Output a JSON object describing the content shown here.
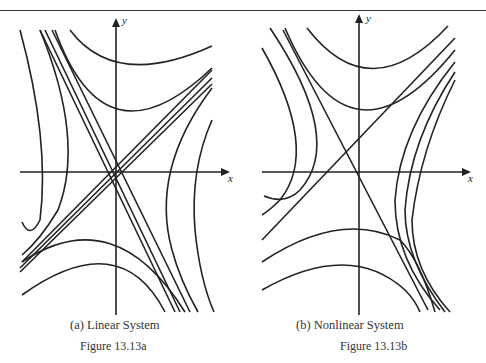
{
  "panels": [
    {
      "caption": "(a) Linear System",
      "figure_label": "Figure 13.13a",
      "x_axis_label": "x",
      "y_axis_label": "y"
    },
    {
      "caption": "(b) Nonlinear System",
      "figure_label": "Figure 13.13b",
      "x_axis_label": "x",
      "y_axis_label": "y"
    }
  ],
  "colors": {
    "ink": "#222222",
    "background": "#ffffff"
  }
}
